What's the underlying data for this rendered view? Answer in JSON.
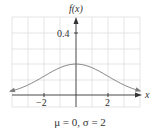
{
  "chart_data": {
    "type": "line",
    "title": "",
    "subtitle": "μ = 0, σ = 2",
    "xlabel": "x",
    "ylabel": "f(x)",
    "xlim": [
      -4,
      4
    ],
    "ylim": [
      -0.05,
      0.48
    ],
    "x_ticks": [
      -2,
      2
    ],
    "x_tick_labels": [
      "−2",
      "2"
    ],
    "y_ticks": [
      0.4
    ],
    "y_tick_labels": [
      "0.4"
    ],
    "grid": true,
    "legend": null,
    "series": [
      {
        "name": "Normal density μ=0, σ=2",
        "mu": 0,
        "sigma": 2,
        "x": [
          -4,
          -3.5,
          -3,
          -2.5,
          -2,
          -1.5,
          -1,
          -0.5,
          0,
          0.5,
          1,
          1.5,
          2,
          2.5,
          3,
          3.5,
          4
        ],
        "y": [
          0.027,
          0.043,
          0.065,
          0.091,
          0.121,
          0.151,
          0.176,
          0.193,
          0.199,
          0.193,
          0.176,
          0.151,
          0.121,
          0.091,
          0.065,
          0.043,
          0.027
        ]
      }
    ],
    "annotations": [
      "arrowheads on both ends of curve",
      "arrowheads on positive x and y axes"
    ]
  },
  "labels": {
    "y_axis": "f(x)",
    "x_axis": "x",
    "tick_y_04": "0.4",
    "tick_x_neg2": "−2",
    "tick_x_pos2": "2",
    "caption": "μ = 0, σ = 2"
  },
  "colors": {
    "grid": "#d9d9d9",
    "axis": "#333333",
    "curve": "#777777"
  }
}
